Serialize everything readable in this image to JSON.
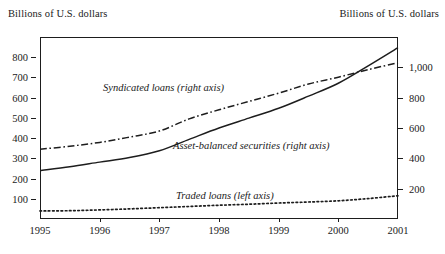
{
  "chart_data": {
    "type": "line",
    "title": "",
    "subtitle": "",
    "left_axis_title": "Billions of U.S. dollars",
    "right_axis_title": "Billions of U.S. dollars",
    "xlabel": "",
    "ylabel": "Billions of U.S. dollars",
    "grid": false,
    "legend_position": "inline-annotations",
    "x": [
      1995,
      1995.5,
      1996,
      1996.5,
      1997,
      1997.5,
      1998,
      1998.5,
      1999,
      1999.5,
      2000,
      2000.5,
      2001
    ],
    "xlim": [
      1995,
      2001
    ],
    "x_tick_labels": [
      "1995",
      "1996",
      "1997",
      "1998",
      "1999",
      "2000",
      "2001"
    ],
    "x_ticks": [
      1995,
      1996,
      1997,
      1998,
      1999,
      2000,
      2001
    ],
    "left_axis": {
      "label": "Billions of U.S. dollars",
      "ticks": [
        100,
        200,
        300,
        400,
        500,
        600,
        700,
        800
      ],
      "tick_labels": [
        "100",
        "200",
        "300",
        "400",
        "500",
        "600",
        "700",
        "800"
      ],
      "ylim": [
        0,
        900
      ]
    },
    "right_axis": {
      "label": "Billions of U.S. dollars",
      "ticks": [
        200,
        400,
        600,
        800,
        1000
      ],
      "tick_labels": [
        "200",
        "400",
        "600",
        "800",
        "1,000"
      ],
      "ylim": [
        0,
        1200
      ]
    },
    "series": [
      {
        "name": "Syndicated loans (right axis)",
        "axis": "right",
        "style": "dash-dot",
        "color": "#1d1d1d",
        "annotation": "Syndicated loans (right axis)",
        "values": [
          460,
          480,
          505,
          540,
          580,
          660,
          720,
          775,
          830,
          890,
          935,
          985,
          1030
        ]
      },
      {
        "name": "Asset-balanced securities (right axis)",
        "axis": "right",
        "style": "solid",
        "color": "#1d1d1d",
        "annotation": "Asset-balanced securities (right axis)",
        "values": [
          320,
          345,
          375,
          405,
          450,
          525,
          600,
          665,
          730,
          810,
          895,
          1010,
          1130
        ]
      },
      {
        "name": "Traded loans (left axis)",
        "axis": "left",
        "style": "dotted",
        "color": "#1d1d1d",
        "annotation": "Traded loans (left axis)",
        "values": [
          40,
          41,
          45,
          50,
          56,
          62,
          68,
          73,
          79,
          84,
          90,
          101,
          115
        ]
      }
    ],
    "annotations": [
      {
        "text": "Syndicated loans (right axis)",
        "x_px": 103,
        "y_px": 82
      },
      {
        "text": "Asset-balanced securities (right axis)",
        "x_px": 173,
        "y_px": 140
      },
      {
        "text": "Traded loans (left axis)",
        "x_px": 176,
        "y_px": 190
      }
    ]
  }
}
